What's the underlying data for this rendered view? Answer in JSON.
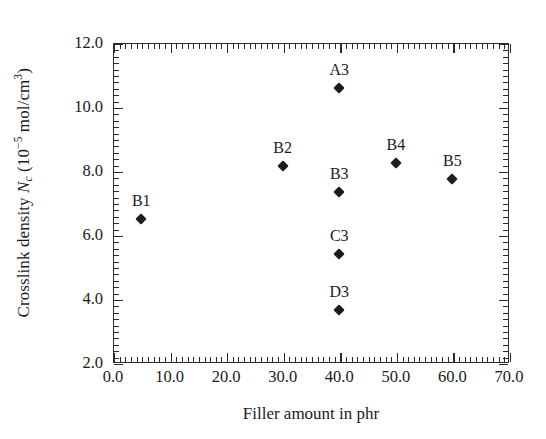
{
  "chart_data": {
    "type": "scatter",
    "title": "",
    "xlabel": "Filler amount in phr",
    "ylabel": "Crosslink density Nc (10^-5 mol/cm^3)",
    "ylabel_parts": {
      "lead": "Crosslink density ",
      "symbol": "N",
      "symbol_sub": "c",
      "open": " (10",
      "exponent": "−5",
      "close": " mol/cm",
      "unit_sup": "3",
      "tail": ")"
    },
    "xlim": [
      0.0,
      70.0
    ],
    "ylim": [
      2.0,
      12.0
    ],
    "xticks": [
      "0.0",
      "10.0",
      "20.0",
      "30.0",
      "40.0",
      "50.0",
      "60.0",
      "70.0"
    ],
    "xtick_values": [
      0,
      10,
      20,
      30,
      40,
      50,
      60,
      70
    ],
    "yticks": [
      "2.0",
      "4.0",
      "6.0",
      "8.0",
      "10.0",
      "12.0"
    ],
    "ytick_values": [
      2,
      4,
      6,
      8,
      10,
      12
    ],
    "x_minor_step": 1,
    "y_minor_step": 0.2,
    "grid": false,
    "legend": "none",
    "marker_color": "#1c1c1c",
    "axis_color": "#2b2b2b",
    "points": [
      {
        "label": "B1",
        "x": 5,
        "y": 6.5,
        "label_dx": 0,
        "label_dy": -9
      },
      {
        "label": "B2",
        "x": 30,
        "y": 8.15,
        "label_dx": 0,
        "label_dy": -9
      },
      {
        "label": "A3",
        "x": 40,
        "y": 10.6,
        "label_dx": 0,
        "label_dy": -9
      },
      {
        "label": "B3",
        "x": 40,
        "y": 7.35,
        "label_dx": 0,
        "label_dy": -9
      },
      {
        "label": "C3",
        "x": 40,
        "y": 5.4,
        "label_dx": 0,
        "label_dy": -9
      },
      {
        "label": "D3",
        "x": 40,
        "y": 3.65,
        "label_dx": 0,
        "label_dy": -9
      },
      {
        "label": "B4",
        "x": 50,
        "y": 8.25,
        "label_dx": 0,
        "label_dy": -9
      },
      {
        "label": "B5",
        "x": 60,
        "y": 7.75,
        "label_dx": 0,
        "label_dy": -9
      }
    ]
  }
}
